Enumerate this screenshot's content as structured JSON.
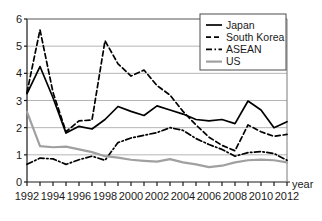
{
  "chart_data": {
    "type": "line",
    "title": "",
    "xlabel": "year",
    "ylabel": "",
    "xlim": [
      1992,
      2012
    ],
    "ylim": [
      0,
      6
    ],
    "grid": true,
    "legend_position": "top-right",
    "x": [
      1992,
      1993,
      1994,
      1995,
      1996,
      1997,
      1998,
      1999,
      2000,
      2001,
      2002,
      2003,
      2004,
      2005,
      2006,
      2007,
      2008,
      2009,
      2010,
      2011,
      2012
    ],
    "yticks": [
      0,
      1,
      2,
      3,
      4,
      5,
      6
    ],
    "xticks": [
      1992,
      1993,
      1994,
      1995,
      1996,
      1997,
      1998,
      1999,
      2000,
      2001,
      2002,
      2003,
      2004,
      2005,
      2006,
      2007,
      2008,
      2009,
      2010,
      2011,
      2012
    ],
    "xtick_labels_shown": [
      1992,
      1994,
      1996,
      1998,
      2000,
      2002,
      2004,
      2006,
      2008,
      2010,
      2012
    ],
    "series": [
      {
        "name": "Japan",
        "style": "solid",
        "color": "#000000",
        "values": [
          3.25,
          4.25,
          3.1,
          1.8,
          2.05,
          1.95,
          2.3,
          2.78,
          2.6,
          2.45,
          2.8,
          2.65,
          2.5,
          2.3,
          2.25,
          2.3,
          2.15,
          2.98,
          2.65,
          2.0,
          2.22
        ]
      },
      {
        "name": "South Korea",
        "style": "dashed",
        "color": "#000000",
        "values": [
          3.3,
          5.6,
          3.3,
          1.85,
          2.25,
          2.28,
          5.2,
          4.35,
          3.9,
          4.12,
          3.55,
          3.2,
          2.6,
          2.1,
          1.65,
          1.35,
          1.15,
          2.1,
          1.85,
          1.68,
          1.75
        ]
      },
      {
        "name": "ASEAN",
        "style": "dashdot",
        "color": "#000000",
        "values": [
          0.65,
          0.88,
          0.85,
          0.65,
          0.82,
          0.95,
          0.8,
          1.45,
          1.62,
          1.72,
          1.82,
          2.0,
          1.9,
          1.6,
          1.38,
          1.2,
          0.95,
          1.08,
          1.12,
          1.05,
          0.8
        ]
      },
      {
        "name": "US",
        "style": "solid",
        "color": "#a0a0a0",
        "values": [
          2.58,
          1.32,
          1.28,
          1.3,
          1.2,
          1.1,
          0.95,
          0.9,
          0.82,
          0.78,
          0.75,
          0.84,
          0.72,
          0.65,
          0.55,
          0.6,
          0.72,
          0.8,
          0.82,
          0.8,
          0.72
        ]
      }
    ]
  },
  "legend": {
    "items": [
      {
        "label": "Japan"
      },
      {
        "label": "South Korea"
      },
      {
        "label": "ASEAN"
      },
      {
        "label": "US"
      }
    ]
  },
  "axis": {
    "x_title": "year"
  }
}
